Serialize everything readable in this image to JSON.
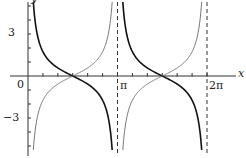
{
  "chart_data": {
    "type": "line",
    "title": "",
    "xlabel": "x",
    "ylabel": "y",
    "x_tick_labels": [
      "0",
      "π",
      "2π"
    ],
    "y_tick_labels": [
      "3",
      "0",
      "−3"
    ],
    "xlim": [
      0,
      6.5
    ],
    "ylim": [
      -5.5,
      5.3
    ],
    "asymptotes": [
      "x = π",
      "x = 2π"
    ],
    "grid": false,
    "series": [
      {
        "name": "cot x",
        "style": "thick black",
        "description": "decreasing branches, +∞ at kπ⁺ to −∞ at (k+1)π⁻, zero at π/2 and 3π/2"
      },
      {
        "name": "−cot x",
        "style": "thin gray",
        "description": "increasing branches, −∞ at kπ⁺ to +∞ at (k+1)π⁻, zero at π/2 and 3π/2"
      }
    ]
  },
  "labels": {
    "x_axis": "x",
    "y_axis": "y",
    "zero": "0",
    "pi": "π",
    "two_pi": "2π",
    "three": "3",
    "neg_three": "−3"
  }
}
